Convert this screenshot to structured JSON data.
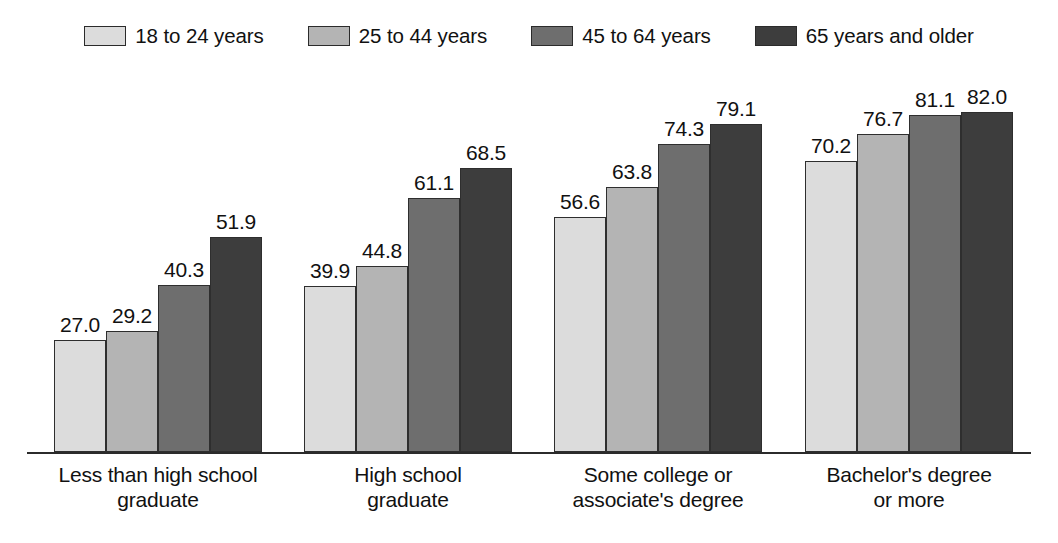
{
  "chart_data": {
    "type": "bar",
    "title": "",
    "subtitle": "",
    "xlabel": "",
    "ylabel": "",
    "ylim": [
      0,
      82
    ],
    "grid": false,
    "legend_position": "top-center",
    "axis_visible": "x-only",
    "categories": [
      "Less than high school graduate",
      "High school graduate",
      "Some college or associate's degree",
      "Bachelor's degree or more"
    ],
    "category_lines": [
      [
        "Less than high school",
        "graduate"
      ],
      [
        "High school",
        "graduate"
      ],
      [
        "Some college or",
        "associate's degree"
      ],
      [
        "Bachelor's degree",
        "or more"
      ]
    ],
    "series": [
      {
        "name": "18 to 24 years",
        "color": "#dcdcdc",
        "values": [
          27.0,
          39.9,
          56.6,
          70.2
        ]
      },
      {
        "name": "25 to 44 years",
        "color": "#b4b4b4",
        "values": [
          29.2,
          44.8,
          63.8,
          76.7
        ]
      },
      {
        "name": "45 to 64 years",
        "color": "#6e6e6e",
        "values": [
          40.3,
          61.1,
          74.3,
          81.1
        ]
      },
      {
        "name": "65 years and older",
        "color": "#3d3d3d",
        "values": [
          51.9,
          68.5,
          79.1,
          82.0
        ]
      }
    ],
    "data_labels": [
      [
        "27.0",
        "29.2",
        "40.3",
        "51.9"
      ],
      [
        "39.9",
        "44.8",
        "61.1",
        "68.5"
      ],
      [
        "56.6",
        "63.8",
        "74.3",
        "79.1"
      ],
      [
        "70.2",
        "76.7",
        "81.1",
        "82.0"
      ]
    ]
  },
  "legend": {
    "items": [
      {
        "label": "18 to 24 years",
        "color": "#dcdcdc"
      },
      {
        "label": "25 to 44 years",
        "color": "#b4b4b4"
      },
      {
        "label": "45 to 64 years",
        "color": "#6e6e6e"
      },
      {
        "label": "65 years and older",
        "color": "#3d3d3d"
      }
    ]
  },
  "layout": {
    "axis_color": "#2b2b2b",
    "bar_border_color": "#2e2e2e",
    "text_color": "#111111",
    "background": "#ffffff",
    "baseline_y": 452,
    "px_per_unit": 4.15,
    "bar_width": 52,
    "group_starts": [
      54,
      304,
      554,
      805
    ]
  }
}
